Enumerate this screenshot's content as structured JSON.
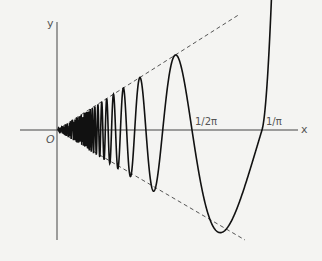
{
  "diagram": {
    "function": "y = x·sin(1/x)",
    "axis_labels": {
      "x": "x",
      "y": "y",
      "origin": "O"
    },
    "tick_labels": [
      "1/2π",
      "1/π"
    ],
    "envelope": "y = ±x (dashed)",
    "colors": {
      "curve": "#111111",
      "axis": "#444444",
      "dashed": "#555555",
      "text": "#555555",
      "background": "#f4f4f2"
    }
  }
}
